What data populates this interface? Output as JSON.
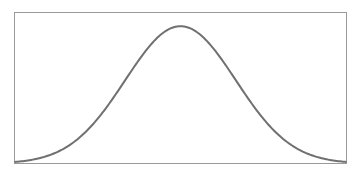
{
  "chart_data": {
    "type": "line",
    "title": "",
    "xlabel": "",
    "ylabel": "",
    "xlim": [
      -3,
      3
    ],
    "ylim": [
      0,
      1.1
    ],
    "grid": false,
    "legend": "none",
    "series": [
      {
        "name": "gaussian",
        "color": "#707070",
        "x": [
          -3,
          -2.75,
          -2.5,
          -2.25,
          -2,
          -1.75,
          -1.5,
          -1.25,
          -1,
          -0.75,
          -0.5,
          -0.25,
          0,
          0.25,
          0.5,
          0.75,
          1,
          1.25,
          1.5,
          1.75,
          2,
          2.25,
          2.5,
          2.75,
          3
        ],
        "y": [
          0.011,
          0.023,
          0.044,
          0.08,
          0.135,
          0.216,
          0.325,
          0.458,
          0.607,
          0.755,
          0.882,
          0.969,
          1.0,
          0.969,
          0.882,
          0.755,
          0.607,
          0.458,
          0.325,
          0.216,
          0.135,
          0.08,
          0.044,
          0.023,
          0.011
        ]
      }
    ]
  }
}
